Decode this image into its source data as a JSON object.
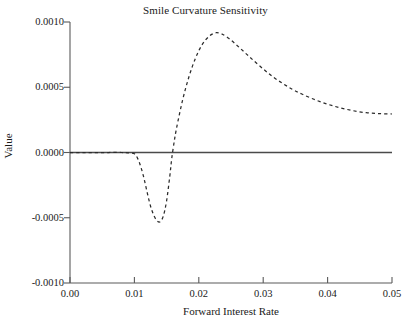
{
  "chart_data": {
    "type": "line",
    "title": "Smile Curvature Sensitivity",
    "xlabel": "Forward Interest Rate",
    "ylabel": "Value",
    "xlim": [
      0.0,
      0.05
    ],
    "ylim": [
      -0.001,
      0.001
    ],
    "xticks": [
      0.0,
      0.01,
      0.02,
      0.03,
      0.04,
      0.05
    ],
    "xtick_labels": [
      "0.00",
      "0.01",
      "0.02",
      "0.03",
      "0.04",
      "0.05"
    ],
    "yticks": [
      -0.001,
      -0.0005,
      0.0,
      0.0005,
      0.001
    ],
    "ytick_labels": [
      "-0.0010",
      "-0.0005",
      "0.0000",
      "0.0005",
      "0.0010"
    ],
    "grid": false,
    "legend": null,
    "series": [
      {
        "name": "Smile Curvature Sensitivity",
        "style": "dashed",
        "color": "#2b2b2b",
        "x": [
          0.0,
          0.002,
          0.004,
          0.006,
          0.008,
          0.009,
          0.01,
          0.0105,
          0.011,
          0.0115,
          0.012,
          0.0125,
          0.013,
          0.0135,
          0.014,
          0.0145,
          0.015,
          0.0155,
          0.0158,
          0.0162,
          0.0165,
          0.017,
          0.0175,
          0.018,
          0.0185,
          0.019,
          0.0195,
          0.02,
          0.0205,
          0.021,
          0.0215,
          0.022,
          0.0227,
          0.0235,
          0.0245,
          0.0255,
          0.0265,
          0.0275,
          0.0285,
          0.03,
          0.0315,
          0.033,
          0.0345,
          0.036,
          0.038,
          0.04,
          0.042,
          0.044,
          0.046,
          0.048,
          0.05
        ],
        "y": [
          0.0,
          0.0,
          0.0,
          0.0,
          0.0,
          -2e-06,
          -1e-05,
          -4.5e-05,
          -0.00011,
          -0.0002,
          -0.00031,
          -0.00041,
          -0.00048,
          -0.000523,
          -0.000531,
          -0.000485,
          -0.00037,
          -0.00018,
          -4.5e-05,
          9e-05,
          0.000175,
          0.000295,
          0.000405,
          0.0005,
          0.000585,
          0.00066,
          0.000725,
          0.00078,
          0.000825,
          0.00086,
          0.000885,
          0.000905,
          0.000918,
          0.00091,
          0.00088,
          0.00084,
          0.000795,
          0.00075,
          0.000705,
          0.00064,
          0.00058,
          0.00053,
          0.000485,
          0.000448,
          0.000405,
          0.00037,
          0.000342,
          0.00032,
          0.000305,
          0.000298,
          0.000295
        ]
      }
    ],
    "annotations": {
      "zero_line": 0.0,
      "trough": {
        "x": 0.0139,
        "y": -0.00053
      },
      "peak": {
        "x": 0.0227,
        "y": 0.00092
      },
      "right_endpoint": {
        "x": 0.05,
        "y": 0.0003
      }
    },
    "colors": {
      "curve": "#2b2b2b",
      "axis": "#5a5a5a",
      "zero_line": "#4a4a4a",
      "background": "#ffffff",
      "text": "#1a1a1a"
    }
  }
}
